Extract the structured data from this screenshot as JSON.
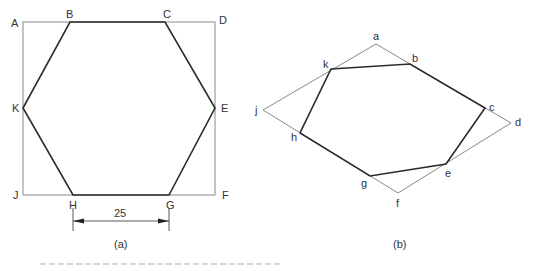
{
  "figure_a": {
    "label": "(a)",
    "square": {
      "x": 23,
      "y": 22,
      "width": 192,
      "height": 173
    },
    "square_corners": {
      "A": "A",
      "D": "D",
      "F": "F",
      "J": "J"
    },
    "hexagon_vertices": {
      "B": "B",
      "C": "C",
      "E": "E",
      "G": "G",
      "H": "H",
      "K": "K"
    },
    "dimension": {
      "value": "25",
      "from": "H",
      "to": "G"
    }
  },
  "figure_b": {
    "label": "(b)",
    "rhombus_vertices": {
      "a": "a",
      "d": "d",
      "f": "f",
      "j": "j"
    },
    "polygon_vertices": {
      "b": "b",
      "c": "c",
      "e": "e",
      "g": "g",
      "h": "h",
      "k": "k"
    }
  },
  "colors": {
    "construction_line": "#8a8a8a",
    "object_line": "#2a2a2a",
    "text": "#333333"
  }
}
